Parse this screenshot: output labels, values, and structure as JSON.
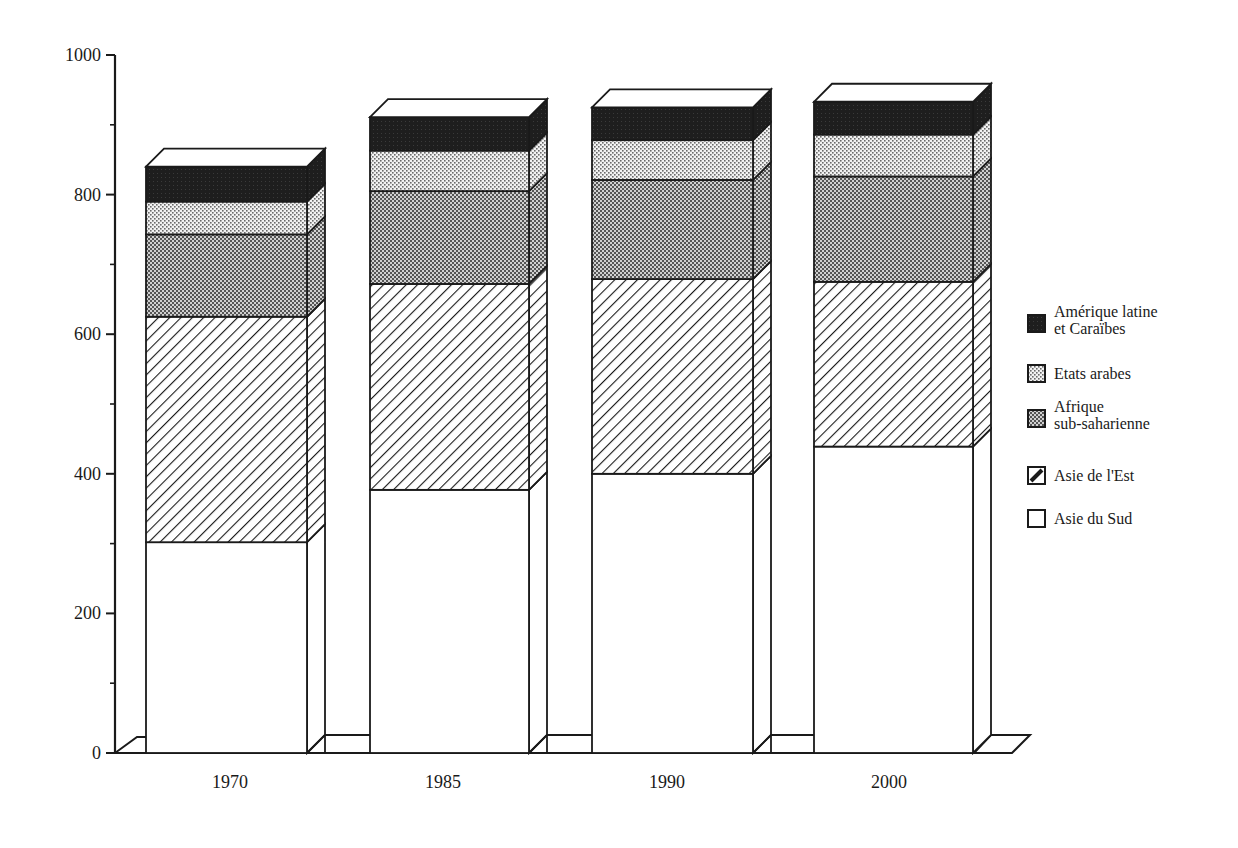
{
  "chart_data": {
    "type": "bar",
    "stacked": true,
    "style": "3d-stacked-bar, black-and-white patterns",
    "title": "",
    "xlabel": "",
    "ylabel": "",
    "ylim": [
      0,
      1000
    ],
    "yticks": [
      0,
      200,
      400,
      600,
      800,
      1000
    ],
    "yminor_ticks": [
      100,
      300,
      500,
      700,
      900
    ],
    "grid": false,
    "legend_position": "right",
    "categories": [
      "1970",
      "1985",
      "1990",
      "2000"
    ],
    "series": [
      {
        "name": "Asie du Sud",
        "pattern": "white",
        "values": [
          302,
          377,
          400,
          439
        ]
      },
      {
        "name": "Asie de l'Est",
        "pattern": "diagonal-hatch",
        "values": [
          323,
          295,
          279,
          236
        ]
      },
      {
        "name": "Afrique sub-saharienne",
        "pattern": "dark-dots",
        "values": [
          118,
          133,
          142,
          151
        ]
      },
      {
        "name": "Etats arabes",
        "pattern": "light-dots",
        "values": [
          47,
          58,
          57,
          60
        ]
      },
      {
        "name": "Amérique latine et Caraïbes",
        "pattern": "black",
        "values": [
          50,
          48,
          47,
          47
        ]
      }
    ],
    "totals": [
      840,
      911,
      925,
      933
    ]
  },
  "legend": {
    "items": [
      {
        "lines": [
          "Amérique latine",
          "et Caraïbes"
        ],
        "pattern": "black"
      },
      {
        "lines": [
          "Etats arabes"
        ],
        "pattern": "light-dots"
      },
      {
        "lines": [
          "Afrique",
          "sub-saharienne"
        ],
        "pattern": "dark-dots"
      },
      {
        "lines": [
          "Asie de l'Est"
        ],
        "pattern": "diagonal-hatch"
      },
      {
        "lines": [
          "Asie du Sud"
        ],
        "pattern": "white"
      }
    ]
  },
  "colors": {
    "ink": "#1a1a1a",
    "background": "#ffffff",
    "black_fill": "#1e1e1e",
    "light_dots_fill": "#d8d8d8",
    "dark_dots_fill": "#8a8a8a"
  }
}
